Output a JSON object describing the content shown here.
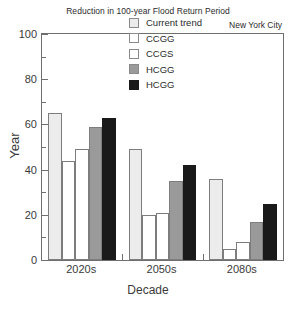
{
  "chart_data": {
    "type": "bar",
    "title": "Reduction in 100-year Flood Return Period",
    "subtitle": "New York City",
    "xlabel": "Decade",
    "ylabel": "Year",
    "categories": [
      "2020s",
      "2050s",
      "2080s"
    ],
    "ylim": [
      0,
      100
    ],
    "yticks": [
      0,
      20,
      40,
      60,
      80,
      100
    ],
    "ytick_labels": [
      "0",
      "20",
      "40",
      "60",
      "80",
      "100"
    ],
    "yminor_ticks": [
      10,
      30,
      50,
      70,
      90
    ],
    "grid": false,
    "legend_position": "top-right inside",
    "series": [
      {
        "name": "Current trend",
        "color": "#ececec",
        "values": [
          65,
          49,
          36
        ]
      },
      {
        "name": "CCGG",
        "color": "#ffffff",
        "values": [
          44,
          20,
          5
        ]
      },
      {
        "name": "CCGS",
        "color": "#ffffff",
        "values": [
          49,
          21,
          8
        ]
      },
      {
        "name": "HCGG",
        "color": "#9a9a9a",
        "values": [
          59,
          35,
          17
        ]
      },
      {
        "name": "HCGG",
        "color": "#1a1a1a",
        "values": [
          63,
          42,
          25
        ]
      }
    ]
  },
  "legend": {
    "items": [
      {
        "label": "Current trend"
      },
      {
        "label": "CCGG"
      },
      {
        "label": "CCGS"
      },
      {
        "label": "HCGG"
      },
      {
        "label": "HCGG"
      }
    ]
  },
  "colors": {
    "frame": "#6f6f6f",
    "bar_edge": "#7d7d7d",
    "text": "#2b2b2b",
    "background": "#ffffff"
  }
}
